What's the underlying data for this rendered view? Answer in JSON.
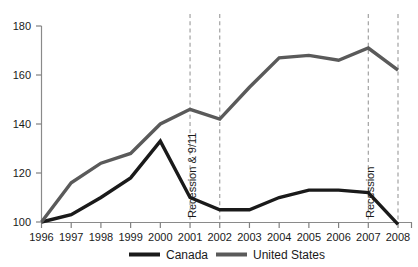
{
  "chart_data": {
    "type": "line",
    "title": "",
    "subtitle": "",
    "xlabel": "",
    "ylabel": "",
    "x": [
      1996,
      1997,
      1998,
      1999,
      2000,
      2001,
      2002,
      2003,
      2004,
      2005,
      2006,
      2007,
      2008
    ],
    "categories": [
      "1996",
      "1997",
      "1998",
      "1999",
      "2000",
      "2001",
      "2002",
      "2003",
      "2004",
      "2005",
      "2006",
      "2007",
      "2008"
    ],
    "series": [
      {
        "name": "Canada",
        "color": "#1a1a1a",
        "values": [
          100,
          103,
          110,
          118,
          133,
          110,
          105,
          105,
          110,
          113,
          113,
          112,
          99
        ]
      },
      {
        "name": "United States",
        "color": "#5a5a5a",
        "values": [
          100,
          116,
          124,
          128,
          140,
          146,
          142,
          155,
          167,
          168,
          166,
          171,
          162
        ]
      }
    ],
    "xlim": [
      1996,
      2008
    ],
    "ylim": [
      96,
      184
    ],
    "yticks": [
      100,
      120,
      140,
      160,
      180
    ],
    "ytick_labels": [
      "100",
      "120",
      "140",
      "160",
      "180"
    ],
    "xtick_labels": [
      "1996",
      "1997",
      "1998",
      "1999",
      "2000",
      "2001",
      "2002",
      "2003",
      "2004",
      "2005",
      "2006",
      "2007",
      "2008"
    ],
    "grid": false,
    "legend_position": "bottom",
    "legend": [
      "Canada",
      "United States"
    ],
    "annotations": [
      {
        "label": "Recession & 9/11",
        "x_start": 2001,
        "x_end": 2002,
        "label_at": 2001
      },
      {
        "label": "Recession",
        "x_start": 2007,
        "x_end": 2008,
        "label_at": 2007
      }
    ],
    "vertical_markers": [
      2001,
      2002,
      2007,
      2008
    ]
  },
  "axis": {
    "y_labels": [
      "180",
      "160",
      "140",
      "120",
      "100"
    ],
    "x_labels": [
      "1996",
      "1997",
      "1998",
      "1999",
      "2000",
      "2001",
      "2002",
      "2003",
      "2004",
      "2005",
      "2006",
      "2007",
      "2008"
    ]
  },
  "annotations": {
    "recession_911": "Recession & 9/11",
    "recession": "Recession"
  },
  "legend": {
    "canada": "Canada",
    "united_states": "United States"
  },
  "colors": {
    "canada_line": "#1a1a1a",
    "us_line": "#5a5a5a",
    "axis": "#808080",
    "dashed_marker": "#9a9a9a",
    "text": "#1a1a1a",
    "background": "#ffffff"
  }
}
